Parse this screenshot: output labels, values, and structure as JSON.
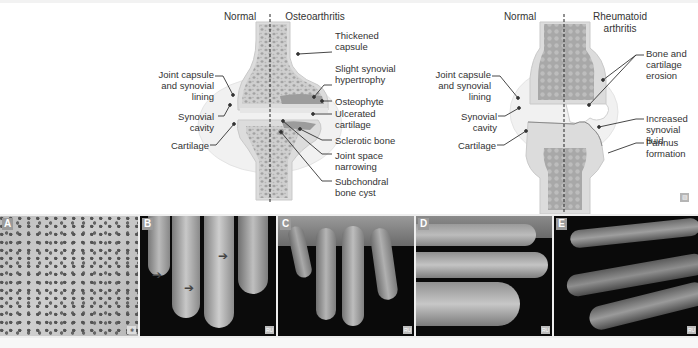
{
  "oa_diagram": {
    "headings": {
      "normal": "Normal",
      "disease": "Osteoarthritis"
    },
    "left_labels": [
      {
        "text": "Joint capsule\nand synovial\nlining"
      },
      {
        "text": "Synovial\ncavity"
      },
      {
        "text": "Cartilage"
      }
    ],
    "right_labels": [
      {
        "text": "Thickened\ncapsule"
      },
      {
        "text": "Slight synovial\nhypertrophy"
      },
      {
        "text": "Osteophyte"
      },
      {
        "text": "Ulcerated\ncartilage"
      },
      {
        "text": "Sclerotic bone"
      },
      {
        "text": "Joint space\nnarrowing"
      },
      {
        "text": "Subchondral\nbone cyst"
      }
    ]
  },
  "ra_diagram": {
    "headings": {
      "normal": "Normal",
      "disease": "Rheumatoid\narthritis"
    },
    "left_labels": [
      {
        "text": "Joint capsule\nand synovial\nlining"
      },
      {
        "text": "Synovial\ncavity"
      },
      {
        "text": "Cartilage"
      }
    ],
    "right_labels": [
      {
        "text": "Bone and\ncartilage\nerosion"
      },
      {
        "text": "Increased\nsynovial fluid"
      },
      {
        "text": "Pannus\nformation"
      }
    ]
  },
  "photos": [
    {
      "label": "A",
      "credit": "✱",
      "subject": "histology-micrograph"
    },
    {
      "label": "B",
      "credit": "RU",
      "subject": "fingers-with-arrows"
    },
    {
      "label": "C",
      "credit": "RU",
      "subject": "hand-deformity-with-arrows"
    },
    {
      "label": "D",
      "credit": "RU",
      "subject": "hand-side-view"
    },
    {
      "label": "E",
      "credit": "RU",
      "subject": "dark-hand-side-view"
    }
  ],
  "colors": {
    "bone": "#d9d9d9",
    "trabecular": "#a6a6a6",
    "capsule": "#efefef",
    "cartilage": "#cfcfcf",
    "leader": "#333333"
  },
  "corner_mark": "▨"
}
